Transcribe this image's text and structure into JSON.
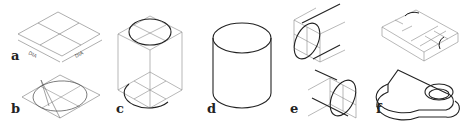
{
  "figure": {
    "line_color": "#888888",
    "stroke_color": "#222222",
    "panels": [
      {
        "label": "a",
        "dim_left": "DIA",
        "dim_right": "DIA"
      },
      {
        "label": "b",
        "marks": [
          "r",
          "r",
          "r",
          "r",
          "R",
          "R"
        ]
      },
      {
        "label": "c"
      },
      {
        "label": "d"
      },
      {
        "label": "e"
      },
      {
        "label": "f"
      }
    ]
  }
}
